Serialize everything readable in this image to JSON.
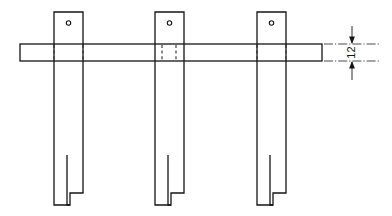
{
  "drawing": {
    "title": "Bracket assembly elevation view",
    "type": "engineering-line-drawing",
    "projection": "front-elevation",
    "units": "mm",
    "canvas": {
      "width": 392,
      "height": 216
    },
    "colors": {
      "line": "#141414",
      "background": "#ffffff",
      "fill": "#ffffff",
      "hidden_line": "#2a2a2a",
      "extension_line": "#2a2a2a"
    },
    "line_weights": {
      "visible": 1.3,
      "hidden": 1.1,
      "extension": 0.8,
      "dimension": 0.9
    },
    "horizontal_plate": {
      "label": "horizontal rail plate",
      "x": 20,
      "y": 44,
      "width": 302,
      "height": 17,
      "edge_style": "solid"
    },
    "vertical_members": [
      {
        "id": "left-post",
        "label": "left vertical post",
        "x": 54,
        "top": 12,
        "width": 29,
        "bottom": 205,
        "hole": {
          "cx": 68.5,
          "cy": 23,
          "r": 2.2,
          "label": "fixing hole"
        },
        "slot": {
          "label": "bottom slot",
          "slot_x": 67,
          "slot_top": 155,
          "slot_width": 3,
          "step_y": 193,
          "leg_bottom": 205
        },
        "hidden_lines": [
          {
            "x": 54,
            "y1": 44,
            "y2": 61
          },
          {
            "x": 83,
            "y1": 44,
            "y2": 61
          }
        ]
      },
      {
        "id": "center-post",
        "label": "center vertical post",
        "x": 155,
        "top": 12,
        "width": 29,
        "bottom": 205,
        "hole": {
          "cx": 169.5,
          "cy": 23,
          "r": 2.2,
          "label": "fixing hole"
        },
        "slot": {
          "label": "bottom slot",
          "slot_x": 168,
          "slot_top": 155,
          "slot_width": 3,
          "step_y": 193,
          "leg_bottom": 205
        },
        "hidden_lines": [
          {
            "x": 162,
            "y1": 44,
            "y2": 61
          },
          {
            "x": 176,
            "y1": 44,
            "y2": 61
          }
        ]
      },
      {
        "id": "right-post",
        "label": "right vertical post",
        "x": 257,
        "top": 12,
        "width": 29,
        "bottom": 205,
        "hole": {
          "cx": 271.5,
          "cy": 23,
          "r": 2.2,
          "label": "fixing hole"
        },
        "slot": {
          "label": "bottom slot",
          "slot_x": 270,
          "slot_top": 155,
          "slot_width": 3,
          "step_y": 193,
          "leg_bottom": 205
        },
        "hidden_lines": [
          {
            "x": 257,
            "y1": 44,
            "y2": 61
          },
          {
            "x": 286,
            "y1": 44,
            "y2": 61
          }
        ]
      }
    ],
    "dimension": {
      "id": "plate-thickness",
      "label": "12",
      "value": 12,
      "unit": "mm",
      "orientation": "vertical",
      "text_rotation": -90,
      "measures": "plate thickness",
      "dim_line_x": 352,
      "y_top": 44,
      "y_bottom": 61,
      "arrow_tail_top": 26,
      "arrow_tail_bottom": 80,
      "text_x": 352,
      "text_y": 53,
      "extension_lines": [
        {
          "y": 44,
          "x1": 324,
          "x2": 380
        },
        {
          "y": 61,
          "x1": 324,
          "x2": 380
        }
      ],
      "arrow_style": "filled-closed-inward"
    }
  }
}
